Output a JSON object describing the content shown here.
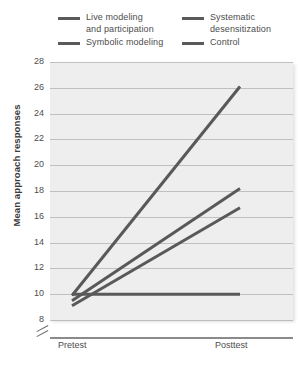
{
  "chart_data": {
    "type": "line",
    "title": "",
    "xlabel": "",
    "ylabel": "Mean approach responses",
    "categories": [
      "Pretest",
      "Posttest"
    ],
    "x": [
      0,
      1
    ],
    "ylim": [
      8,
      28
    ],
    "yticks": [
      8,
      10,
      12,
      14,
      16,
      18,
      20,
      22,
      24,
      26,
      28
    ],
    "ytick_labels": [
      "8",
      "10",
      "12",
      "14",
      "16",
      "18",
      "20",
      "22",
      "24",
      "26",
      "28"
    ],
    "xtick_labels": [
      "Pretest",
      "Posttest"
    ],
    "grid": true,
    "y_axis_break": true,
    "legend_position": "top",
    "series": [
      {
        "name": "Live modeling\nand participation",
        "values": [
          9.9,
          26.1
        ],
        "color": "#595959"
      },
      {
        "name": "Systematic\ndesensitization",
        "values": [
          9.5,
          18.2
        ],
        "color": "#595959"
      },
      {
        "name": "Symbolic modeling",
        "values": [
          9.1,
          16.7
        ],
        "color": "#595959"
      },
      {
        "name": "Control",
        "values": [
          10.0,
          10.0
        ],
        "color": "#595959"
      }
    ]
  },
  "legend": {
    "items": [
      {
        "label": "Live modeling\nand participation",
        "color": "#595959"
      },
      {
        "label": "Systematic\ndesensitization",
        "color": "#595959"
      },
      {
        "label": "Symbolic modeling",
        "color": "#595959"
      },
      {
        "label": "Control",
        "color": "#595959"
      }
    ]
  },
  "axes": {
    "y_title": "Mean approach responses"
  }
}
